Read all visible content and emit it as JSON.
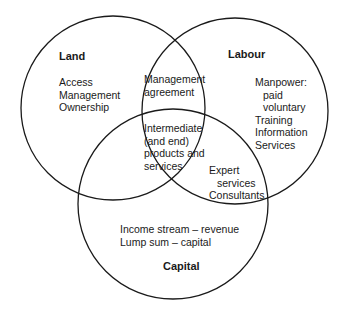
{
  "circles": {
    "land": {
      "title": "Land",
      "items": [
        "Access",
        "Management",
        "Ownership"
      ]
    },
    "labour": {
      "title": "Labour",
      "items": [
        "Manpower:",
        "paid",
        "voluntary",
        "Training",
        "Information",
        "Services"
      ]
    },
    "capital": {
      "title": "Capital",
      "items": [
        "Income stream – revenue",
        "Lump sum – capital"
      ]
    }
  },
  "intersections": {
    "land_labour": [
      "Management",
      "agreement"
    ],
    "all_three": [
      "Intermediate",
      "(and end)",
      "products and",
      "services"
    ],
    "labour_capital": [
      "Expert",
      "services",
      "Consultants"
    ]
  },
  "colors": {
    "stroke": "#1a1a1a",
    "background": "#ffffff"
  }
}
